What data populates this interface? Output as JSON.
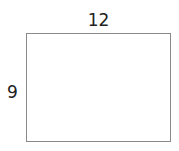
{
  "diagram": {
    "shape": "rectangle",
    "width_label": "12",
    "height_label": "9",
    "stroke_color": "#8a8a8a",
    "text_color": "#222222"
  }
}
